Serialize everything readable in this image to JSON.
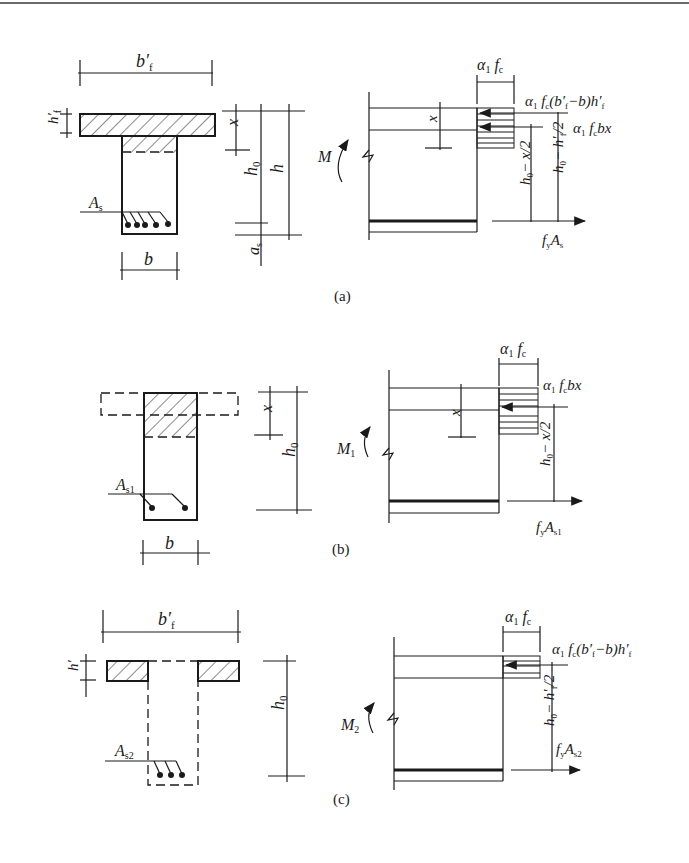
{
  "figure": {
    "panels": [
      {
        "caption": "(a)",
        "section": {
          "flange_width_label": "b′",
          "flange_width_sub": "f",
          "flange_thickness_label": "h′",
          "flange_thickness_sub": "f",
          "web_width_label": "b",
          "steel_label": "A",
          "steel_sub": "s",
          "depth_x": "x",
          "depth_h0": "h",
          "depth_h0_sub": "0",
          "depth_h": "h",
          "cover_label": "a",
          "cover_sub": "s"
        },
        "stress": {
          "moment_label": "M",
          "moment_sub": "",
          "stress_width_label": "α",
          "stress_width_sub1": "1",
          "stress_width_f": "f",
          "stress_width_sub2": "c",
          "force_flange": "α₁ f꜀(b′f−b)h′f",
          "force_web": "α₁ f꜀bx",
          "arm_web": "h₀− x/2",
          "arm_flange": "h₀− h′f/2",
          "steel_force": "f",
          "steel_force_sub": "y",
          "steel_force_A": "A",
          "steel_force_A_sub": "s",
          "depth_x": "x"
        }
      },
      {
        "caption": "(b)",
        "section": {
          "web_width_label": "b",
          "steel_label": "A",
          "steel_sub": "s1",
          "depth_x": "x",
          "depth_h0": "h",
          "depth_h0_sub": "0"
        },
        "stress": {
          "moment_label": "M",
          "moment_sub": "1",
          "force_web": "α₁ f꜀bx",
          "arm_web": "h₀− x/2",
          "steel_force": "f",
          "steel_force_sub": "y",
          "steel_force_A": "A",
          "steel_force_A_sub": "s1",
          "depth_x": "x"
        }
      },
      {
        "caption": "(c)",
        "section": {
          "flange_width_label": "b′",
          "flange_width_sub": "f",
          "flange_thickness_label": "h′",
          "steel_label": "A",
          "steel_sub": "s2",
          "depth_h0": "h",
          "depth_h0_sub": "0"
        },
        "stress": {
          "moment_label": "M",
          "moment_sub": "2",
          "force_flange": "α₁ f꜀(b′f−b)h′f",
          "arm_flange": "h₀− h′f/2",
          "steel_force": "f",
          "steel_force_sub": "y",
          "steel_force_A": "A",
          "steel_force_A_sub": "s2"
        }
      }
    ],
    "greek": {
      "alpha": "α",
      "one": "1",
      "f": "f",
      "c": "c",
      "two": "2"
    }
  }
}
